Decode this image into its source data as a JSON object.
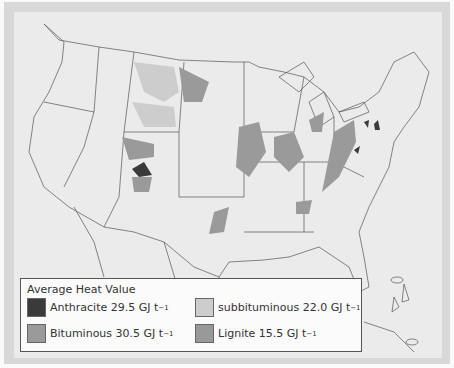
{
  "legend": {
    "title": "Average Heat Value",
    "items": [
      {
        "name": "Anthracite",
        "value": "29.5",
        "unit": "GJ t",
        "exp": "−1",
        "color": "#3a3a3a"
      },
      {
        "name": "subbituminous",
        "value": "22.0",
        "unit": "GJ t",
        "exp": "−1",
        "color": "#cdcdcd"
      },
      {
        "name": "Bituminous",
        "value": "30.5",
        "unit": "GJ t",
        "exp": "−1",
        "color": "#9a9a9a"
      },
      {
        "name": "Lignite",
        "value": "15.5",
        "unit": "GJ t",
        "exp": "−1",
        "color": "#999999"
      }
    ]
  },
  "labels": {
    "anthracite": "Anthracite 29.5 GJ t",
    "subbituminous": "subbituminous 22.0 GJ t",
    "bituminous": "Bituminous 30.5 GJ t",
    "lignite": "Lignite 15.5 GJ t",
    "exp": "−1"
  }
}
